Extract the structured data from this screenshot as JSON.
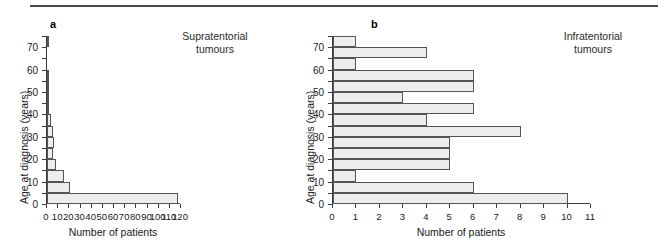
{
  "figure": {
    "panels": [
      {
        "letter": "a",
        "title": "Supratentorial\ntumours",
        "xlabel": "Number of patients",
        "ylabel": "Age at diagnosis (years)"
      },
      {
        "letter": "b",
        "title": "Infratentorial\ntumours",
        "xlabel": "Number of patients",
        "ylabel": "Age at diagnosis (years)"
      }
    ]
  },
  "chart_data": [
    {
      "type": "bar",
      "orientation": "horizontal",
      "title": "Supratentorial tumours",
      "xlabel": "Number of patients",
      "ylabel": "Age at diagnosis (years)",
      "xlim": [
        0,
        120
      ],
      "ylim": [
        0,
        75
      ],
      "xticks": [
        0,
        10,
        20,
        30,
        40,
        50,
        60,
        70,
        80,
        90,
        100,
        110,
        120
      ],
      "xticklabels": [
        "0",
        "10",
        "20",
        "30",
        "40",
        "50",
        "60",
        "70",
        "80",
        "90",
        "100",
        "110",
        "120"
      ],
      "yticks": [
        0,
        10,
        20,
        30,
        40,
        50,
        60,
        70
      ],
      "yticklabels": [
        "0",
        "10",
        "20",
        "30",
        "40",
        "50",
        "60",
        "70"
      ],
      "bin_width": 5,
      "grid": false,
      "legend": null,
      "categories": [
        "0-5",
        "5-10",
        "10-15",
        "15-20",
        "20-25",
        "25-30",
        "30-35",
        "35-40",
        "40-45",
        "45-50",
        "50-55",
        "55-60",
        "60-65",
        "65-70",
        "70-75"
      ],
      "bin_starts": [
        0,
        5,
        10,
        15,
        20,
        25,
        30,
        35,
        40,
        45,
        50,
        55,
        60,
        65,
        70
      ],
      "values": [
        117,
        21,
        15,
        8,
        5,
        6,
        5,
        4,
        2,
        1,
        2,
        2,
        0,
        0,
        1
      ]
    },
    {
      "type": "bar",
      "orientation": "horizontal",
      "title": "Infratentorial tumours",
      "xlabel": "Number of patients",
      "ylabel": "Age at diagnosis (years)",
      "xlim": [
        0,
        11
      ],
      "ylim": [
        0,
        75
      ],
      "xticks": [
        0,
        1,
        2,
        3,
        4,
        5,
        6,
        7,
        8,
        9,
        10,
        11
      ],
      "xticklabels": [
        "0",
        "1",
        "2",
        "3",
        "4",
        "5",
        "6",
        "7",
        "8",
        "9",
        "10",
        "11"
      ],
      "yticks": [
        0,
        10,
        20,
        30,
        40,
        50,
        60,
        70
      ],
      "yticklabels": [
        "0",
        "10",
        "20",
        "30",
        "40",
        "50",
        "60",
        "70"
      ],
      "bin_width": 5,
      "grid": false,
      "legend": null,
      "categories": [
        "0-5",
        "5-10",
        "10-15",
        "15-20",
        "20-25",
        "25-30",
        "30-35",
        "35-40",
        "40-45",
        "45-50",
        "50-55",
        "55-60",
        "60-65",
        "65-70",
        "70-75"
      ],
      "bin_starts": [
        0,
        5,
        10,
        15,
        20,
        25,
        30,
        35,
        40,
        45,
        50,
        55,
        60,
        65,
        70
      ],
      "values": [
        10,
        6,
        1,
        5,
        5,
        5,
        8,
        4,
        6,
        3,
        6,
        6,
        1,
        4,
        1
      ]
    }
  ],
  "colors": {
    "bar_fill": "#ededed",
    "bar_stipple": "#a8a8a8",
    "bar_edge": "#555555",
    "axis": "#3a3a3a",
    "text": "#1a1a1a",
    "rule": "#4a4a4a",
    "background": "#ffffff"
  }
}
